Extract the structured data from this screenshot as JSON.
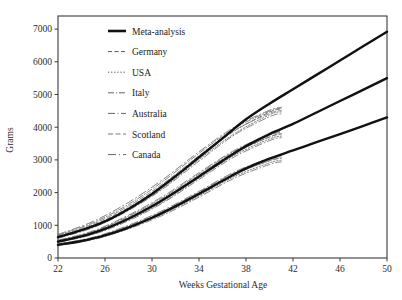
{
  "chart_data": {
    "type": "line",
    "title": "",
    "xlabel": "Weeks Gestational Age",
    "ylabel": "Grams",
    "xlim": [
      22,
      50
    ],
    "ylim": [
      0,
      7400
    ],
    "xticks": [
      22,
      26,
      30,
      34,
      38,
      42,
      46,
      50
    ],
    "yticks": [
      0,
      1000,
      2000,
      3000,
      4000,
      5000,
      6000,
      7000
    ],
    "grid": false,
    "legend_position": "upper-left-inside",
    "legend": [
      {
        "label": "Meta-analysis",
        "style": "solid",
        "dash": "none",
        "width": 2.4,
        "color": "#111111"
      },
      {
        "label": "Germany",
        "style": "dashed",
        "dash": "4,2.5",
        "width": 0.8,
        "color": "#555555"
      },
      {
        "label": "USA",
        "style": "dotted",
        "dash": "1.3,1.8",
        "width": 0.8,
        "color": "#555555"
      },
      {
        "label": "Italy",
        "style": "dashdot",
        "dash": "6,2,1,2",
        "width": 0.8,
        "color": "#666666"
      },
      {
        "label": "Australia",
        "style": "dashdot",
        "dash": "7,2.5,1,2.5",
        "width": 0.8,
        "color": "#666666"
      },
      {
        "label": "Scotland",
        "style": "dashed-long",
        "dash": "5,2.5",
        "width": 0.8,
        "color": "#777777"
      },
      {
        "label": "Canada",
        "style": "dashdot",
        "dash": "8,3,1,3",
        "width": 0.8,
        "color": "#666666"
      }
    ],
    "bands": [
      "90th percentile",
      "50th percentile",
      "10th percentile"
    ],
    "series": [
      {
        "name": "Meta-analysis 90th",
        "country": "Meta-analysis",
        "band": "90th",
        "x": [
          22,
          24,
          26,
          28,
          30,
          32,
          34,
          36,
          38,
          40,
          42,
          44,
          46,
          48,
          50
        ],
        "y": [
          640,
          850,
          1120,
          1500,
          1960,
          2500,
          3080,
          3660,
          4240,
          4720,
          5160,
          5600,
          6040,
          6480,
          6920
        ]
      },
      {
        "name": "Meta-analysis 50th",
        "country": "Meta-analysis",
        "band": "50th",
        "x": [
          22,
          24,
          26,
          28,
          30,
          32,
          34,
          36,
          38,
          40,
          42,
          44,
          46,
          48,
          50
        ],
        "y": [
          500,
          660,
          890,
          1200,
          1580,
          2020,
          2490,
          2970,
          3420,
          3790,
          4100,
          4450,
          4800,
          5150,
          5500
        ]
      },
      {
        "name": "Meta-analysis 10th",
        "country": "Meta-analysis",
        "band": "10th",
        "x": [
          22,
          24,
          26,
          28,
          30,
          32,
          34,
          36,
          38,
          40,
          42,
          44,
          46,
          48,
          50
        ],
        "y": [
          400,
          520,
          690,
          930,
          1230,
          1580,
          1960,
          2360,
          2740,
          3040,
          3290,
          3540,
          3790,
          4040,
          4300
        ]
      },
      {
        "name": "Germany 90th",
        "country": "Germany",
        "band": "90th",
        "x": [
          22,
          25,
          28,
          31,
          34,
          37,
          40,
          41
        ],
        "y": [
          660,
          1000,
          1540,
          2240,
          3080,
          3880,
          4460,
          4560
        ]
      },
      {
        "name": "Germany 50th",
        "country": "Germany",
        "band": "50th",
        "x": [
          22,
          25,
          28,
          31,
          34,
          37,
          40,
          41
        ],
        "y": [
          510,
          770,
          1220,
          1790,
          2500,
          3200,
          3700,
          3800
        ]
      },
      {
        "name": "Germany 10th",
        "country": "Germany",
        "band": "10th",
        "x": [
          22,
          25,
          28,
          31,
          34,
          37,
          40,
          41
        ],
        "y": [
          410,
          600,
          950,
          1400,
          1950,
          2550,
          2980,
          3060
        ]
      },
      {
        "name": "USA 90th",
        "country": "USA",
        "band": "90th",
        "x": [
          22,
          25,
          28,
          31,
          34,
          37,
          40,
          41
        ],
        "y": [
          620,
          960,
          1470,
          2160,
          3010,
          3800,
          4380,
          4470
        ]
      },
      {
        "name": "USA 50th",
        "country": "USA",
        "band": "50th",
        "x": [
          22,
          25,
          28,
          31,
          34,
          37,
          40,
          41
        ],
        "y": [
          490,
          740,
          1170,
          1730,
          2440,
          3140,
          3640,
          3730
        ]
      },
      {
        "name": "USA 10th",
        "country": "USA",
        "band": "10th",
        "x": [
          22,
          25,
          28,
          31,
          34,
          37,
          40,
          41
        ],
        "y": [
          400,
          580,
          920,
          1360,
          1900,
          2490,
          2910,
          2990
        ]
      },
      {
        "name": "Italy 90th",
        "country": "Italy",
        "band": "90th",
        "x": [
          22,
          25,
          28,
          31,
          34,
          37,
          40,
          41
        ],
        "y": [
          700,
          1080,
          1640,
          2360,
          3200,
          3960,
          4490,
          4580
        ]
      },
      {
        "name": "Italy 50th",
        "country": "Italy",
        "band": "50th",
        "x": [
          22,
          25,
          28,
          31,
          34,
          37,
          40,
          41
        ],
        "y": [
          530,
          810,
          1280,
          1860,
          2570,
          3260,
          3750,
          3840
        ]
      },
      {
        "name": "Italy 10th",
        "country": "Italy",
        "band": "10th",
        "x": [
          22,
          25,
          28,
          31,
          34,
          37,
          40,
          41
        ],
        "y": [
          420,
          620,
          980,
          1440,
          2010,
          2600,
          3020,
          3100
        ]
      },
      {
        "name": "Australia 90th",
        "country": "Australia",
        "band": "90th",
        "x": [
          22,
          25,
          28,
          31,
          34,
          37,
          40,
          41
        ],
        "y": [
          600,
          930,
          1450,
          2130,
          2960,
          3760,
          4320,
          4410
        ]
      },
      {
        "name": "Australia 50th",
        "country": "Australia",
        "band": "50th",
        "x": [
          22,
          25,
          28,
          31,
          34,
          37,
          40,
          41
        ],
        "y": [
          480,
          720,
          1140,
          1700,
          2400,
          3090,
          3590,
          3680
        ]
      },
      {
        "name": "Australia 10th",
        "country": "Australia",
        "band": "10th",
        "x": [
          22,
          25,
          28,
          31,
          34,
          37,
          40,
          41
        ],
        "y": [
          390,
          565,
          890,
          1320,
          1860,
          2440,
          2860,
          2940
        ]
      },
      {
        "name": "Scotland 90th",
        "country": "Scotland",
        "band": "90th",
        "x": [
          22,
          25,
          28,
          31,
          34,
          37,
          40,
          41
        ],
        "y": [
          680,
          1040,
          1590,
          2290,
          3130,
          3900,
          4420,
          4510
        ]
      },
      {
        "name": "Scotland 50th",
        "country": "Scotland",
        "band": "50th",
        "x": [
          22,
          25,
          28,
          31,
          34,
          37,
          40,
          41
        ],
        "y": [
          520,
          790,
          1250,
          1820,
          2530,
          3220,
          3700,
          3790
        ]
      },
      {
        "name": "Scotland 10th",
        "country": "Scotland",
        "band": "10th",
        "x": [
          22,
          25,
          28,
          31,
          34,
          37,
          40,
          41
        ],
        "y": [
          415,
          605,
          960,
          1410,
          1970,
          2560,
          2970,
          3050
        ]
      },
      {
        "name": "Canada 90th",
        "country": "Canada",
        "band": "90th",
        "x": [
          22,
          25,
          28,
          31,
          34,
          37,
          40,
          41
        ],
        "y": [
          720,
          1120,
          1700,
          2420,
          3250,
          4000,
          4520,
          4610
        ]
      },
      {
        "name": "Canada 50th",
        "country": "Canada",
        "band": "50th",
        "x": [
          22,
          25,
          28,
          31,
          34,
          37,
          40,
          41
        ],
        "y": [
          545,
          830,
          1310,
          1900,
          2610,
          3290,
          3780,
          3870
        ]
      },
      {
        "name": "Canada 10th",
        "country": "Canada",
        "band": "10th",
        "x": [
          22,
          25,
          28,
          31,
          34,
          37,
          40,
          41
        ],
        "y": [
          430,
          635,
          1000,
          1470,
          2040,
          2630,
          3050,
          3130
        ]
      }
    ]
  },
  "colors": {
    "axis": "#3a3a3a",
    "meta": "#111111",
    "country": "#6a6a6a",
    "background": "#ffffff"
  }
}
